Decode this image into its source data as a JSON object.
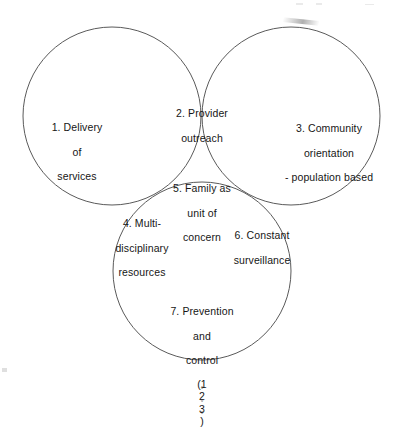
{
  "diagram": {
    "type": "three-circle-venn",
    "colors": {
      "background": "#ffffff",
      "circle_outline": "#5a5a5a",
      "lens_fill": "#c9c9c9",
      "lens_border": "#767676",
      "text": "#161616"
    },
    "circles": [
      {
        "id": "delivery",
        "label": "1. Delivery of services"
      },
      {
        "id": "community",
        "label": "3. Community orientation - population based"
      },
      {
        "id": "prevention",
        "label": "7. Prevention and control (1° 2° 3°)"
      }
    ],
    "regions": [
      {
        "id": "delivery",
        "number": "1.",
        "lines": [
          "1. Delivery",
          "of",
          "services"
        ],
        "shaded": false
      },
      {
        "id": "provider-outreach",
        "number": "2.",
        "lines": [
          "2. Provider",
          "outreach"
        ],
        "shaded": true
      },
      {
        "id": "community-orientation",
        "number": "3.",
        "lines": [
          "3. Community",
          "orientation",
          "- population based"
        ],
        "shaded": false
      },
      {
        "id": "multidisciplinary-resources",
        "number": "4.",
        "lines": [
          "4. Multi-",
          "disciplinary",
          "resources"
        ],
        "shaded": true
      },
      {
        "id": "family-unit-of-concern",
        "number": "5.",
        "lines": [
          "5. Family as",
          "unit of",
          "concern"
        ],
        "shaded": true
      },
      {
        "id": "constant-surveillance",
        "number": "6.",
        "lines": [
          "6. Constant",
          "surveillance"
        ],
        "shaded": true
      },
      {
        "id": "prevention-and-control",
        "number": "7.",
        "lines": [
          "7. Prevention",
          "and",
          "control",
          "(1° 2° 3°)"
        ],
        "shaded": false
      }
    ]
  },
  "labels": {
    "delivery": {
      "l1": "1. Delivery",
      "l2": "of",
      "l3": "services"
    },
    "provider": {
      "l1": "2. Provider",
      "l2": "outreach"
    },
    "community": {
      "l1": "3. Community",
      "l2": "orientation",
      "l3": "- population based"
    },
    "family": {
      "l1": "5. Family as",
      "l2": "unit of",
      "l3": "concern"
    },
    "multi": {
      "l1": "4. Multi-",
      "l2": "disciplinary",
      "l3": "resources"
    },
    "surveillance": {
      "l1": "6. Constant",
      "l2": "surveillance"
    },
    "prevention": {
      "l1": "7. Prevention",
      "l2": "and",
      "l3": "control",
      "l4_open": "(1",
      "l4_deg1": "°",
      "l4_n2": " 2",
      "l4_deg2": "°",
      "l4_n3": " 3",
      "l4_deg3": "°",
      "l4_close": ")"
    }
  }
}
